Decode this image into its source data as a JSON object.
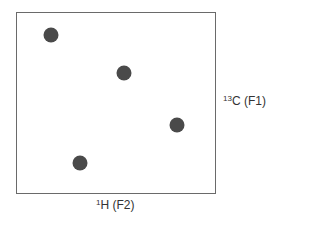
{
  "diagram": {
    "type": "2D NMR correlation spectrum (HSQC/HETCOR schematic)",
    "axes": {
      "f1": {
        "isotope_mass": "13",
        "nucleus": "C",
        "dimension": "(F1)",
        "position": "right"
      },
      "f2": {
        "isotope_mass": "1",
        "nucleus": "H",
        "dimension": "(F2)",
        "position": "bottom"
      }
    },
    "peak_color": "#4a4a4a",
    "border_color": "#6a6a6a",
    "peaks": [
      {
        "id": 1,
        "x_px": 51,
        "y_px": 35
      },
      {
        "id": 2,
        "x_px": 124,
        "y_px": 73
      },
      {
        "id": 3,
        "x_px": 177,
        "y_px": 125
      },
      {
        "id": 4,
        "x_px": 80,
        "y_px": 163
      }
    ]
  }
}
